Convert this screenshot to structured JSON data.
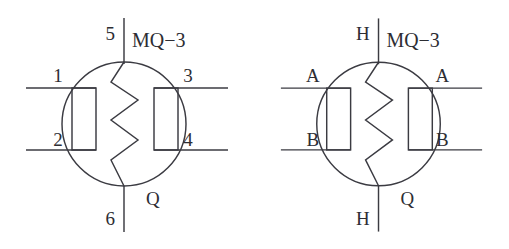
{
  "figure": {
    "background_color": "#ffffff",
    "line_color": "#3b3b42",
    "text_color": "#2d2d33"
  },
  "diagrams": [
    {
      "id": "numbered-pinout",
      "part_label": "MQ−3",
      "output_label": "Q",
      "labels": {
        "top_lead": "5",
        "bottom_lead": "6",
        "left_upper": "1",
        "left_lower": "2",
        "right_upper": "3",
        "right_lower": "4"
      }
    },
    {
      "id": "lettered-pinout",
      "part_label": "MQ−3",
      "output_label": "Q",
      "labels": {
        "top_lead": "H",
        "bottom_lead": "H",
        "left_upper": "A",
        "left_lower": "B",
        "right_upper": "A",
        "right_lower": "B"
      }
    }
  ],
  "geometry": {
    "circle_cx": 124,
    "circle_cy": 124,
    "circle_r": 62,
    "lead_top_y": 18,
    "lead_bottom_y": 232,
    "lead_upper_y": 88,
    "lead_lower_y": 150,
    "lead_left_x": 26,
    "lead_right_x": 228,
    "box_left_x": 72,
    "box_right_x": 154,
    "box_width": 24,
    "box_top_y": 88,
    "box_bottom_y": 150
  }
}
